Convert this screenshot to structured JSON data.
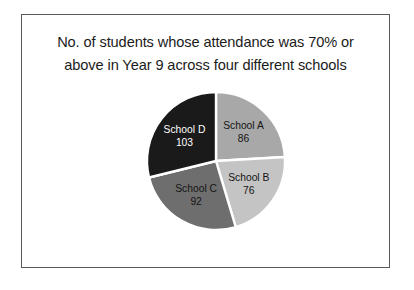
{
  "figure": {
    "border_color": "#5a5a5a",
    "background": "#ffffff"
  },
  "title": {
    "line1": "No. of students whose attendance was 70% or",
    "line2": "above in Year 9 across four different schools"
  },
  "chart_data": {
    "type": "pie",
    "title": "No. of students whose attendance was 70% or above in Year 9 across four different schools",
    "xlabel": "",
    "ylabel": "",
    "legend": "none",
    "labels_inside_slices": true,
    "start_angle_deg": 0,
    "direction": "clockwise",
    "total": 357,
    "categories": [
      "School A",
      "School B",
      "School C",
      "School D"
    ],
    "values": [
      86,
      76,
      92,
      103
    ],
    "slices": [
      {
        "label": "School A",
        "value": 86,
        "value_text": "86",
        "color": "#a8a8a8",
        "text_color": "#141414",
        "angle_deg": 86.7,
        "percent": 24.1
      },
      {
        "label": "School B",
        "value": 76,
        "value_text": "76",
        "color": "#c4c4c4",
        "text_color": "#141414",
        "angle_deg": 76.6,
        "percent": 21.3
      },
      {
        "label": "School C",
        "value": 92,
        "value_text": "92",
        "color": "#6e6e6e",
        "text_color": "#141414",
        "angle_deg": 92.8,
        "percent": 25.8
      },
      {
        "label": "School D",
        "value": 103,
        "value_text": "103",
        "color": "#1a1a1a",
        "text_color": "#ffffff",
        "angle_deg": 103.9,
        "percent": 28.9
      }
    ],
    "separator_color": "#ffffff"
  }
}
